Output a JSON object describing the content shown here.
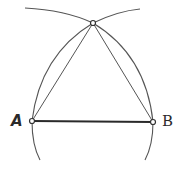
{
  "diagram": {
    "points": {
      "A": {
        "label": "A",
        "x": 32,
        "y": 121
      },
      "B": {
        "label": "B",
        "x": 153,
        "y": 122
      },
      "C": {
        "label": "",
        "x": 93,
        "y": 23
      }
    },
    "segments": [
      "AB",
      "AC",
      "BC"
    ],
    "arcs": [
      {
        "center": "A",
        "radius": "AB"
      },
      {
        "center": "B",
        "radius": "AB"
      }
    ],
    "colors": {
      "stroke": "#3a3a3a",
      "background": "#ffffff"
    }
  }
}
